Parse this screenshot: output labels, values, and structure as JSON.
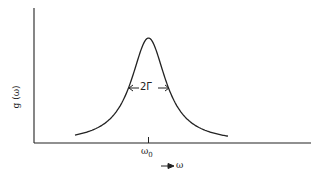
{
  "chart_data": {
    "type": "line",
    "title": "",
    "xlabel": "ω",
    "ylabel": "g (ω)",
    "annotations": [
      "2Γ",
      "ω0"
    ],
    "x_ticks": [
      {
        "label": "ω0",
        "position": "center"
      }
    ],
    "y_ticks": [],
    "grid": false,
    "legend": null,
    "series": [
      {
        "name": "g(ω)",
        "shape": "lorentzian",
        "center_label": "ω0",
        "width_label": "2Γ",
        "x": [
          -1.0,
          -0.8,
          -0.6,
          -0.4,
          -0.3,
          -0.2,
          -0.1,
          0.0,
          0.1,
          0.2,
          0.3,
          0.4,
          0.6,
          0.8,
          1.0
        ],
        "values": [
          0.04,
          0.06,
          0.1,
          0.2,
          0.3,
          0.5,
          0.8,
          1.0,
          0.8,
          0.5,
          0.3,
          0.2,
          0.1,
          0.06,
          0.04
        ]
      }
    ]
  },
  "labels": {
    "y_axis": "g (ω)",
    "x_center": "ω0",
    "x_center_base": "ω",
    "x_center_sub": "0",
    "x_axis_arrow": "⟶ ω",
    "width": "2Γ"
  },
  "colors": {
    "ink": "#222222",
    "background": "#ffffff"
  }
}
